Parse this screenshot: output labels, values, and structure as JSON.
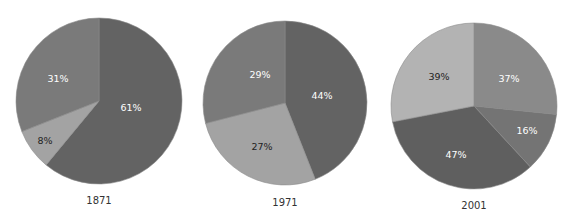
{
  "chart_data": [
    {
      "type": "pie",
      "title": "1871",
      "center": [
        99,
        101
      ],
      "radius": 83,
      "slices": [
        {
          "label": "61%",
          "value": 61,
          "color": "#636363",
          "label_color": "#ffffff",
          "label_pos": [
            131,
            108
          ]
        },
        {
          "label": "8%",
          "value": 8,
          "color": "#a3a3a3",
          "label_color": "#222222",
          "label_pos": [
            45,
            141
          ]
        },
        {
          "label": "31%",
          "value": 31,
          "color": "#7a7a7a",
          "label_color": "#ffffff",
          "label_pos": [
            58,
            79
          ]
        }
      ]
    },
    {
      "type": "pie",
      "title": "1971",
      "center": [
        285,
        103
      ],
      "radius": 82,
      "slices": [
        {
          "label": "44%",
          "value": 44,
          "color": "#636363",
          "label_color": "#ffffff",
          "label_pos": [
            322,
            96
          ]
        },
        {
          "label": "27%",
          "value": 27,
          "color": "#a3a3a3",
          "label_color": "#222222",
          "label_pos": [
            262,
            147
          ]
        },
        {
          "label": "29%",
          "value": 29,
          "color": "#7a7a7a",
          "label_color": "#ffffff",
          "label_pos": [
            260,
            75
          ]
        }
      ]
    },
    {
      "type": "pie",
      "title": "2001",
      "center": [
        474,
        106
      ],
      "radius": 83,
      "slices": [
        {
          "label": "37%",
          "value": 37,
          "color": "#8a8a8a",
          "label_color": "#ffffff",
          "label_pos": [
            509,
            79
          ]
        },
        {
          "label": "16%",
          "value": 16,
          "color": "#747474",
          "label_color": "#ffffff",
          "label_pos": [
            527,
            131
          ]
        },
        {
          "label": "47%",
          "value": 47,
          "color": "#5f5f5f",
          "label_color": "#ffffff",
          "label_pos": [
            456,
            155
          ]
        },
        {
          "label": "39%",
          "value": 39,
          "color": "#b3b3b3",
          "label_color": "#222222",
          "label_pos": [
            439,
            77
          ]
        }
      ]
    }
  ],
  "year_label_offset": 100
}
